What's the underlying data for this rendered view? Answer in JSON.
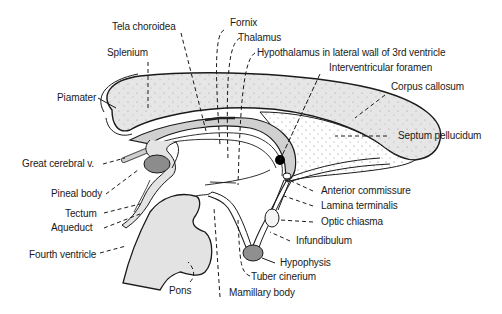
{
  "diagram": {
    "colors": {
      "tissue_fill": "#e6e6e6",
      "pons_fill": "#e3e3e3",
      "pineal_fill": "#8c8c8c",
      "hypophysis_fill": "#8f8f8f",
      "outline": "#1a1a1a",
      "foramen": "#000000"
    },
    "labels": {
      "tela_choroidea": "Tela choroidea",
      "fornix": "Fornix",
      "thalamus": "Thalamus",
      "splenium": "Splenium",
      "hypothalamus": "Hypothalamus in lateral wall of 3rd ventricle",
      "interventricular_foramen": "Interventricular foramen",
      "piamater": "Piamater",
      "corpus_callosum": "Corpus callosum",
      "septum_pellucidum": "Septum pellucidum",
      "great_cerebral_v": "Great cerebral v.",
      "pineal_body": "Pineal body",
      "anterior_commissure": "Anterior commissure",
      "lamina_terminalis": "Lamina terminalis",
      "tectum": "Tectum",
      "optic_chiasma": "Optic chiasma",
      "aqueduct": "Aqueduct",
      "infundibulum": "Infundibulum",
      "fourth_ventricle": "Fourth ventricle",
      "hypophysis": "Hypophysis",
      "tuber_cinerium": "Tuber cinerium",
      "pons": "Pons",
      "mamillary_body": "Mamillary body"
    }
  }
}
